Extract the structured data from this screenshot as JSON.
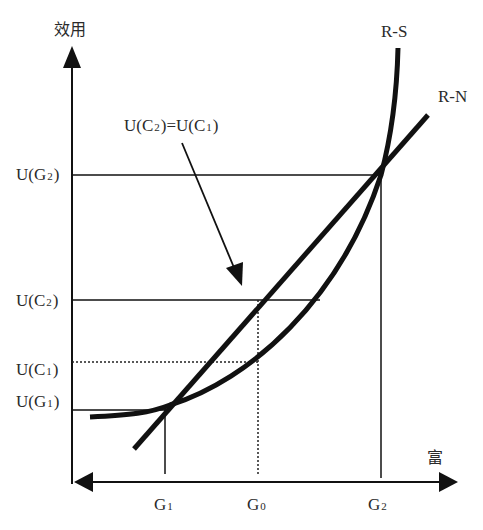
{
  "diagram": {
    "axes": {
      "y_label": "效用",
      "x_label": "富"
    },
    "curves": [
      {
        "name": "R-S",
        "label": "R-S",
        "shape": "convex curve"
      },
      {
        "name": "R-N",
        "label": "R-N",
        "shape": "straight line"
      }
    ],
    "y_ticks": [
      {
        "id": "UG2",
        "main": "U(G",
        "sub": "2",
        "end": ")",
        "style": "solid"
      },
      {
        "id": "UC2",
        "main": "U(C",
        "sub": "2",
        "end": ")",
        "style": "solid"
      },
      {
        "id": "UC1",
        "main": "U(C",
        "sub": "1",
        "end": ")",
        "style": "dotted"
      },
      {
        "id": "UG1",
        "main": "U(G",
        "sub": "1",
        "end": ")",
        "style": "solid"
      }
    ],
    "x_ticks": [
      {
        "id": "G1",
        "main": "G",
        "sub": "1",
        "style": "solid"
      },
      {
        "id": "G0",
        "main": "G",
        "sub": "0",
        "style": "dotted"
      },
      {
        "id": "G2",
        "main": "G",
        "sub": "2",
        "style": "solid"
      }
    ],
    "annotation": {
      "part1": "U(C",
      "sub1": "2",
      "part2": ")=U(C",
      "sub2": "1",
      "part3": ")"
    },
    "colors": {
      "line": "#111111",
      "text": "#2a2a2a",
      "background": "#ffffff"
    }
  }
}
